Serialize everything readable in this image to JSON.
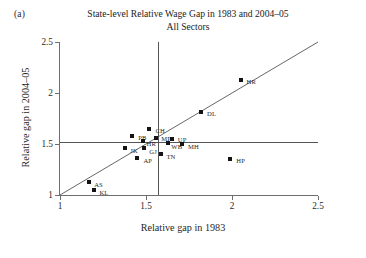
{
  "figure": {
    "panel_label": "(a)",
    "title_main": "State-level Relative Wage Gap in 1983 and 2004–05",
    "title_sub": "All Sectors"
  },
  "chart_data": {
    "type": "scatter",
    "title": "State-level Relative Wage Gap in 1983 and 2004–05 All Sectors",
    "xlabel": "Relative gap in 1983",
    "ylabel": "Relative gap in 2004–05",
    "xlim": [
      1,
      2.5
    ],
    "ylim": [
      1,
      2.5
    ],
    "xticks": [
      "1",
      "1.5",
      "2",
      "2.5"
    ],
    "xtick_values": [
      1,
      1.5,
      2,
      2.5
    ],
    "yticks": [
      "1",
      "1.5",
      "2",
      "2.5"
    ],
    "ytick_values": [
      1,
      1.5,
      2,
      2.5
    ],
    "grid": false,
    "legend": "none",
    "points": [
      {
        "label": "HR",
        "x": 2.05,
        "y": 2.13,
        "label_dx": 6,
        "label_dy": 3
      },
      {
        "label": "DL",
        "x": 1.82,
        "y": 1.81,
        "label_dx": 6,
        "label_dy": 3
      },
      {
        "label": "CH",
        "x": 1.52,
        "y": 1.65,
        "label_dx": 6,
        "label_dy": 3
      },
      {
        "label": "PB",
        "x": 1.42,
        "y": 1.58,
        "label_dx": 6,
        "label_dy": 3
      },
      {
        "label": "MP",
        "x": 1.56,
        "y": 1.56,
        "label_dx": 5,
        "label_dy": 2
      },
      {
        "label": "HR",
        "x": 1.48,
        "y": 1.53,
        "label_dx": 4,
        "label_dy": 4
      },
      {
        "label": "UP",
        "x": 1.65,
        "y": 1.55,
        "label_dx": 6,
        "label_dy": 2
      },
      {
        "label": "MH",
        "x": 1.71,
        "y": 1.5,
        "label_dx": 6,
        "label_dy": 4
      },
      {
        "label": "WB",
        "x": 1.63,
        "y": 1.51,
        "label_dx": 3,
        "label_dy": 5
      },
      {
        "label": "JK",
        "x": 1.38,
        "y": 1.46,
        "label_dx": 5,
        "label_dy": 4
      },
      {
        "label": "GJ",
        "x": 1.49,
        "y": 1.46,
        "label_dx": 5,
        "label_dy": 5
      },
      {
        "label": "TN",
        "x": 1.59,
        "y": 1.4,
        "label_dx": 5,
        "label_dy": 4
      },
      {
        "label": "AP",
        "x": 1.45,
        "y": 1.36,
        "label_dx": 6,
        "label_dy": 4
      },
      {
        "label": "HP",
        "x": 1.99,
        "y": 1.35,
        "label_dx": 6,
        "label_dy": 3
      },
      {
        "label": "AS",
        "x": 1.17,
        "y": 1.13,
        "label_dx": 5,
        "label_dy": 4
      },
      {
        "label": "KL",
        "x": 1.2,
        "y": 1.05,
        "label_dx": 5,
        "label_dy": 4
      }
    ],
    "reference_lines": {
      "identity": {
        "type": "diagonal",
        "from": [
          1,
          1
        ],
        "to": [
          2.5,
          2.5
        ]
      },
      "vertical": {
        "type": "vertical",
        "x": 1.57
      },
      "horizontal": {
        "type": "horizontal",
        "y": 1.52
      }
    }
  }
}
